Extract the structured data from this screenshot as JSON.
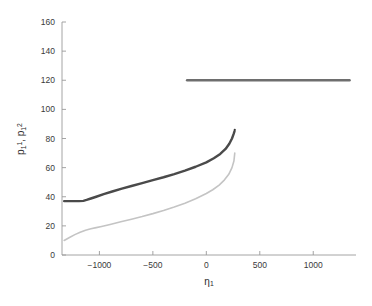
{
  "chart_data": {
    "type": "line",
    "title": "",
    "xlabel": "η₁",
    "ylabel": "p₁¹, p₁²",
    "xlim": [
      -1350,
      1400
    ],
    "ylim": [
      0,
      160
    ],
    "xticks": [
      -1000,
      -500,
      0,
      500,
      1000
    ],
    "xticklabels": [
      "−1000",
      "−500",
      "0",
      "500",
      "1000"
    ],
    "yticks": [
      0,
      20,
      40,
      60,
      80,
      100,
      120,
      140,
      160
    ],
    "yticklabels": [
      "0",
      "20",
      "40",
      "60",
      "80",
      "100",
      "120",
      "140",
      "160"
    ],
    "grid": false,
    "legend": "none",
    "series": [
      {
        "name": "p_1^1 lower branch",
        "color": "#c4c4c4",
        "linewidth": 1.6,
        "x": [
          -1330,
          -1280,
          -1230,
          -1180,
          -1130,
          -1080,
          -1030,
          -980,
          -900,
          -800,
          -700,
          -600,
          -500,
          -400,
          -300,
          -200,
          -100,
          0,
          60,
          120,
          170,
          210,
          240,
          258,
          266
        ],
        "y": [
          10.0,
          12.0,
          14.0,
          15.6,
          17.0,
          18.0,
          18.8,
          19.6,
          21.0,
          22.8,
          24.6,
          26.4,
          28.4,
          30.6,
          33.0,
          35.6,
          38.6,
          42.2,
          44.8,
          48.0,
          51.6,
          55.4,
          60.0,
          64.5,
          70.0
        ]
      },
      {
        "name": "p_1^2 upper branch",
        "color": "#4a4a4a",
        "linewidth": 2.4,
        "x": [
          -1330,
          -1260,
          -1190,
          -1150,
          -1120,
          -1080,
          -1030,
          -960,
          -880,
          -790,
          -700,
          -600,
          -500,
          -400,
          -300,
          -200,
          -100,
          0,
          70,
          130,
          180,
          215,
          240,
          255,
          264
        ],
        "y": [
          37.0,
          37.0,
          37.0,
          37.2,
          37.8,
          38.8,
          40.0,
          41.8,
          43.6,
          45.6,
          47.4,
          49.4,
          51.4,
          53.4,
          55.6,
          58.0,
          60.6,
          63.6,
          66.4,
          69.4,
          72.8,
          76.4,
          80.0,
          83.0,
          85.0
        ]
      },
      {
        "name": "upper constant branch",
        "color": "#6e6e6e",
        "linewidth": 2.4,
        "x": [
          -180,
          1340
        ],
        "y": [
          120.0,
          120.0
        ]
      }
    ],
    "markers": [
      {
        "name": "branch-endpoint",
        "x": 266,
        "y": 86.0,
        "color": "#3a3a3a"
      }
    ]
  },
  "axes_geometry": {
    "left_px": 62,
    "right_px": 356,
    "top_px": 22,
    "bottom_px": 255
  }
}
